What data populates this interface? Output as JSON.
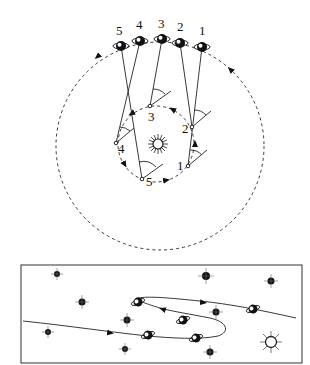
{
  "diagram": {
    "top_panel": {
      "sun": {
        "label": "Sun",
        "x": 158,
        "y": 144
      },
      "earth_orbit": {
        "cx": 156,
        "cy": 144,
        "r": 38
      },
      "planet_orbit": {
        "cx": 160,
        "cy": 146,
        "r": 104
      },
      "earth_positions": [
        {
          "label": "1",
          "x": 188,
          "y": 166
        },
        {
          "label": "2",
          "x": 192,
          "y": 127
        },
        {
          "label": "3",
          "x": 150,
          "y": 106
        },
        {
          "label": "4",
          "x": 116,
          "y": 143
        },
        {
          "label": "5",
          "x": 142,
          "y": 179
        }
      ],
      "planet_positions": [
        {
          "label": "1",
          "x": 202,
          "y": 47
        },
        {
          "label": "2",
          "x": 180,
          "y": 43
        },
        {
          "label": "3",
          "x": 162,
          "y": 39
        },
        {
          "label": "4",
          "x": 140,
          "y": 41
        },
        {
          "label": "5",
          "x": 121,
          "y": 46
        }
      ]
    },
    "bottom_panel": {
      "description": "Apparent path of the planet against background stars showing retrograde loop",
      "stars": [
        {
          "x": 57,
          "y": 274,
          "r": 3
        },
        {
          "x": 82,
          "y": 302,
          "r": 3.5
        },
        {
          "x": 48,
          "y": 332,
          "r": 3
        },
        {
          "x": 127,
          "y": 320,
          "r": 3.5
        },
        {
          "x": 125,
          "y": 349,
          "r": 3
        },
        {
          "x": 206,
          "y": 276,
          "r": 4
        },
        {
          "x": 271,
          "y": 281,
          "r": 3.5
        },
        {
          "x": 216,
          "y": 312,
          "r": 3.5
        },
        {
          "x": 210,
          "y": 352,
          "r": 3.5
        }
      ],
      "sun": {
        "x": 271,
        "y": 342
      },
      "planets": [
        {
          "x": 148,
          "y": 335
        },
        {
          "x": 138,
          "y": 302
        },
        {
          "x": 183,
          "y": 320
        },
        {
          "x": 196,
          "y": 338
        },
        {
          "x": 253,
          "y": 309
        }
      ]
    }
  }
}
